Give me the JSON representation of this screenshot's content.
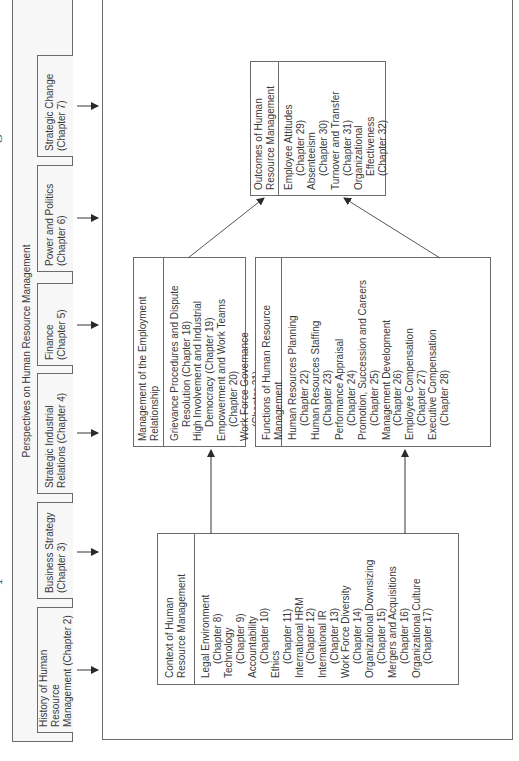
{
  "perspectives": {
    "title": "Perspectives on Human Resource Management",
    "boxes": [
      {
        "line1": "History of Human Resource",
        "line2": "Management (Chapter 2)"
      },
      {
        "line1": "Business Strategy",
        "line2": "(Chapter 3)"
      },
      {
        "line1": "Strategic Industrial",
        "line2": "Relations (Chapter 4)"
      },
      {
        "line1": "Finance",
        "line2": "(Chapter 5)"
      },
      {
        "line1": "Power and Politics",
        "line2": "(Chapter 6)"
      },
      {
        "line1": "Strategic Change",
        "line2": "(Chapter 7)"
      }
    ]
  },
  "context": {
    "header_line1": "Context of Human",
    "header_line2": "Resource Management",
    "items": [
      {
        "title": "Legal Environment",
        "chapter": "(Chapter 8)"
      },
      {
        "title": "Technology",
        "chapter": "(Chapter 9)"
      },
      {
        "title": "Accountability",
        "chapter": "(Chapter 10)"
      },
      {
        "title": "Ethics",
        "chapter": "(Chapter 11)"
      },
      {
        "title": "International HRM",
        "chapter": "(Chapter 12)"
      },
      {
        "title": "International IR",
        "chapter": "(Chapter 13)"
      },
      {
        "title": "Work Force Diversity",
        "chapter": "(Chapter 14)"
      },
      {
        "title": "Organizational Downsizing",
        "chapter": "(Chapter 15)"
      },
      {
        "title": "Mergers and Acquisitions",
        "chapter": "(Chapter 16)"
      },
      {
        "title": "Organizational Culture",
        "chapter": "(Chapter 17)"
      }
    ]
  },
  "employment": {
    "header_line1": "Management of the Employment",
    "header_line2": "Relationship",
    "items": [
      {
        "line1": "Grievance Procedures and Dispute",
        "line2": "Resolution (Chapter 18)"
      },
      {
        "line1": "High Involvement and Industrial",
        "line2": "Democracy (Chapter 19)"
      },
      {
        "line1": "Empowerment and Work Teams",
        "line2": "(Chapter 20)"
      },
      {
        "line1": "Work Force Governance",
        "line2": "(Chapter 21)"
      }
    ]
  },
  "functions": {
    "header_line1": "Functions of Human Resource",
    "header_line2": "Management",
    "items": [
      {
        "title": "Human Resources Planning",
        "chapter": "(Chapter 22)"
      },
      {
        "title": "Human Resources Staffing",
        "chapter": "(Chapter 23)"
      },
      {
        "title": "Performance Appraisal",
        "chapter": "(Chapter 24)"
      },
      {
        "title": "Promotion, Succession and Careers",
        "chapter": "(Chapter 25)"
      },
      {
        "title": "Management Development",
        "chapter": "(Chapter 26)"
      },
      {
        "title": "Employee Compensation",
        "chapter": "(Chapter 27)"
      },
      {
        "title": "Executive Compensation",
        "chapter": "(Chapter 28)"
      }
    ]
  },
  "outcomes": {
    "header_line1": "Outcomes of Human",
    "header_line2": "Resource Management",
    "items": [
      {
        "title": "Employee Attitudes",
        "chapter": "(Chapter 29)"
      },
      {
        "title": "Absenteeism",
        "chapter": "(Chapter 30)"
      },
      {
        "title": "Turnover and Transfer",
        "chapter": "(Chapter 31)"
      },
      {
        "title": "Organizational",
        "chapter": "Effectiveness",
        "chapter2": "(Chapter 32)"
      }
    ]
  },
  "fragments": {
    "left": "1",
    "right": "G"
  },
  "colors": {
    "line": "#6b6b6b",
    "text": "#3a3a3a",
    "band_bg": "#f7f7f7"
  }
}
